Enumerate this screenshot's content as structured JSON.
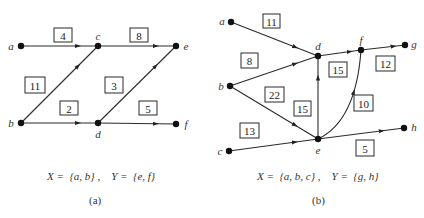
{
  "diagrams": [
    {
      "id": "a",
      "sublabel": "(a)",
      "caption": "X =  {a, b} ,    Y =  {e, f}",
      "nodes": [
        {
          "name": "a",
          "x": 21,
          "y": 46,
          "lx": 11,
          "ly": 46
        },
        {
          "name": "c",
          "x": 98,
          "y": 46,
          "lx": 98,
          "ly": 36
        },
        {
          "name": "e",
          "x": 176,
          "y": 46,
          "lx": 186,
          "ly": 46
        },
        {
          "name": "b",
          "x": 21,
          "y": 123,
          "lx": 11,
          "ly": 123
        },
        {
          "name": "d",
          "x": 98,
          "y": 123,
          "lx": 98,
          "ly": 134
        },
        {
          "name": "f",
          "x": 176,
          "y": 124,
          "lx": 186,
          "ly": 124
        }
      ],
      "edges": [
        {
          "from": "a",
          "to": "c",
          "weight": "4",
          "box": [
            54,
            28,
            18,
            14
          ]
        },
        {
          "from": "c",
          "to": "e",
          "weight": "8",
          "box": [
            130,
            28,
            18,
            14
          ]
        },
        {
          "from": "b",
          "to": "c",
          "weight": "11",
          "box": [
            25,
            77,
            20,
            16
          ]
        },
        {
          "from": "d",
          "to": "e",
          "weight": "3",
          "box": [
            105,
            77,
            18,
            16
          ]
        },
        {
          "from": "b",
          "to": "d",
          "weight": "2",
          "box": [
            60,
            101,
            18,
            14
          ]
        },
        {
          "from": "d",
          "to": "f",
          "weight": "5",
          "box": [
            139,
            101,
            18,
            14
          ]
        }
      ]
    },
    {
      "id": "b",
      "sublabel": "(b)",
      "caption": "X =  {a, b, c} ,    Y =  {g, h}",
      "nodes": [
        {
          "name": "a",
          "x": 231,
          "y": 22,
          "lx": 222,
          "ly": 21
        },
        {
          "name": "b",
          "x": 230,
          "y": 86,
          "lx": 221,
          "ly": 86
        },
        {
          "name": "c",
          "x": 229,
          "y": 151,
          "lx": 220,
          "ly": 151
        },
        {
          "name": "d",
          "x": 318,
          "y": 56,
          "lx": 318,
          "ly": 46
        },
        {
          "name": "f",
          "x": 361,
          "y": 50,
          "lx": 361,
          "ly": 40
        },
        {
          "name": "g",
          "x": 405,
          "y": 45,
          "lx": 414,
          "ly": 44
        },
        {
          "name": "e",
          "x": 318,
          "y": 139,
          "lx": 318,
          "ly": 150
        },
        {
          "name": "h",
          "x": 404,
          "y": 128,
          "lx": 414,
          "ly": 127
        }
      ],
      "edges": [
        {
          "from": "a",
          "to": "d",
          "weight": "11",
          "box": [
            263,
            14,
            17,
            14
          ]
        },
        {
          "from": "b",
          "to": "d",
          "weight": "8",
          "box": [
            241,
            53,
            17,
            15
          ]
        },
        {
          "from": "b",
          "to": "e",
          "weight": "22",
          "box": [
            265,
            87,
            19,
            15
          ]
        },
        {
          "from": "d",
          "to": "f",
          "weight": "15",
          "box": [
            329,
            62,
            18,
            15
          ]
        },
        {
          "from": "e",
          "to": "d",
          "weight": "15",
          "box": [
            294,
            101,
            17,
            15
          ]
        },
        {
          "from": "f",
          "to": "g",
          "weight": "12",
          "box": [
            376,
            56,
            19,
            15
          ]
        },
        {
          "from": "e",
          "to": "f",
          "weight": "10",
          "box": [
            354,
            95,
            19,
            16
          ],
          "curved": true
        },
        {
          "from": "c",
          "to": "e",
          "weight": "13",
          "box": [
            240,
            123,
            19,
            15
          ]
        },
        {
          "from": "e",
          "to": "h",
          "weight": "5",
          "box": [
            356,
            140,
            18,
            16
          ]
        }
      ]
    }
  ]
}
